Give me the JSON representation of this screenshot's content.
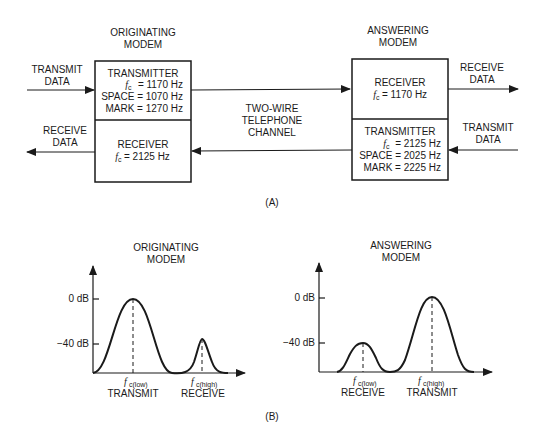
{
  "part_a": {
    "caption": "(A)",
    "originating": {
      "title_line1": "ORIGINATING",
      "title_line2": "MODEM",
      "transmitter": {
        "label": "TRANSMITTER",
        "fc": "= 1170 Hz",
        "space": "SPACE = 1070 Hz",
        "mark": "MARK = 1270 Hz"
      },
      "receiver": {
        "label": "RECEIVER",
        "fc": "= 2125 Hz"
      },
      "transmit_data_line1": "TRANSMIT",
      "transmit_data_line2": "DATA",
      "receive_data_line1": "RECEIVE",
      "receive_data_line2": "DATA"
    },
    "answering": {
      "title_line1": "ANSWERING",
      "title_line2": "MODEM",
      "receiver": {
        "label": "RECEIVER",
        "fc": "= 1170 Hz"
      },
      "transmitter": {
        "label": "TRANSMITTER",
        "fc": "= 2125 Hz",
        "space": "SPACE = 2025 Hz",
        "mark": "MARK = 2225 Hz"
      },
      "receive_data_line1": "RECEIVE",
      "receive_data_line2": "DATA",
      "transmit_data_line1": "TRANSMIT",
      "transmit_data_line2": "DATA"
    },
    "channel_line1": "TWO-WIRE",
    "channel_line2": "TELEPHONE",
    "channel_line3": "CHANNEL",
    "fc_symbol": "f",
    "fc_subscript": "c"
  },
  "part_b": {
    "caption": "(B)",
    "left": {
      "title_line1": "ORIGINATING",
      "title_line2": "MODEM",
      "y_tick_0": "0 dB",
      "y_tick_40": "−40 dB",
      "peak1_sub": "c(low)",
      "peak1_label": "TRANSMIT",
      "peak2_sub": "c(high)",
      "peak2_label": "RECEIVE"
    },
    "right": {
      "title_line1": "ANSWERING",
      "title_line2": "MODEM",
      "y_tick_0": "0 dB",
      "y_tick_40": "−40 dB",
      "peak1_sub": "c(low)",
      "peak1_label": "RECEIVE",
      "peak2_sub": "c(high)",
      "peak2_label": "TRANSMIT"
    },
    "f_symbol": "f"
  }
}
